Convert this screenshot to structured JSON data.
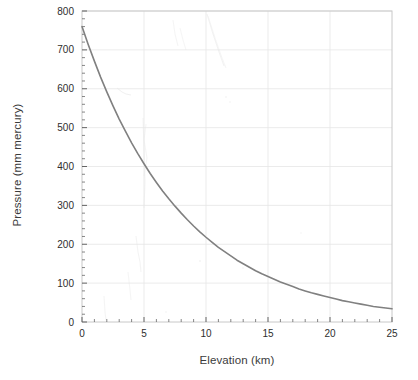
{
  "chart_data": {
    "type": "line",
    "title": "",
    "xlabel": "Elevation  (km)",
    "ylabel": "Pressure (mm mercury)",
    "xlim": [
      0,
      25
    ],
    "ylim": [
      0,
      800
    ],
    "xticks": [
      0,
      5,
      10,
      15,
      20,
      25
    ],
    "xtick_labels": [
      "0",
      "5",
      "10",
      "15",
      "20",
      "25"
    ],
    "yticks": [
      0,
      100,
      200,
      300,
      400,
      500,
      600,
      700,
      800
    ],
    "ytick_labels": [
      "0",
      "100",
      "200",
      "300",
      "400",
      "500",
      "600",
      "700",
      "800"
    ],
    "x_minor_step": 1,
    "y_minor_step": 20,
    "grid": true,
    "grid_color": "#e6e6e6",
    "legend": null,
    "series": [
      {
        "name": "Atmospheric pressure",
        "color": "#808080",
        "line_width": 1.6,
        "x": [
          0,
          0.5,
          1,
          1.5,
          2,
          2.5,
          3,
          3.5,
          4,
          4.5,
          5,
          5.5,
          6,
          6.5,
          7,
          7.5,
          8,
          8.5,
          9,
          9.5,
          10,
          10.5,
          11,
          11.5,
          12,
          12.5,
          13,
          13.5,
          14,
          14.5,
          15,
          15.5,
          16,
          16.5,
          17,
          17.5,
          18,
          18.5,
          19,
          19.5,
          20,
          20.5,
          21,
          21.5,
          22,
          22.5,
          23,
          23.5,
          24,
          24.5,
          25
        ],
        "y": [
          760,
          714,
          671,
          630,
          592,
          556,
          522,
          491,
          461,
          433,
          407,
          382,
          359,
          337,
          317,
          298,
          280,
          263,
          247,
          232,
          218,
          205,
          192,
          181,
          170,
          159,
          150,
          141,
          132,
          124,
          117,
          110,
          103,
          97,
          91,
          85,
          80,
          75,
          71,
          67,
          63,
          59,
          55,
          52,
          49,
          46,
          43,
          40,
          38,
          36,
          34
        ]
      }
    ],
    "annotations": []
  },
  "axes": {
    "x_title": "Elevation  (km)",
    "y_title": "Pressure (mm mercury)"
  }
}
